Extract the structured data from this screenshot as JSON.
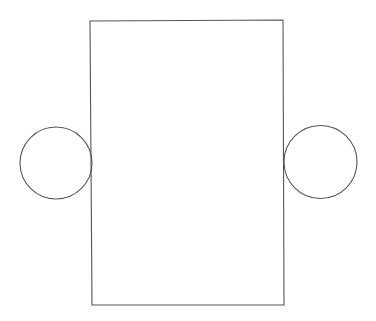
{
  "diagram": {
    "background": "#ffffff",
    "stroke_color": "#555555",
    "shapes": {
      "rectangle": {
        "x1": 90,
        "y1": 21,
        "x2": 283,
        "y2": 20,
        "x3": 284,
        "y3": 305,
        "x4": 92,
        "y4": 305
      },
      "left_circle": {
        "cx": 56,
        "cy": 163,
        "r": 36
      },
      "right_circle": {
        "cx": 320.5,
        "cy": 162,
        "r": 36.5
      }
    }
  }
}
